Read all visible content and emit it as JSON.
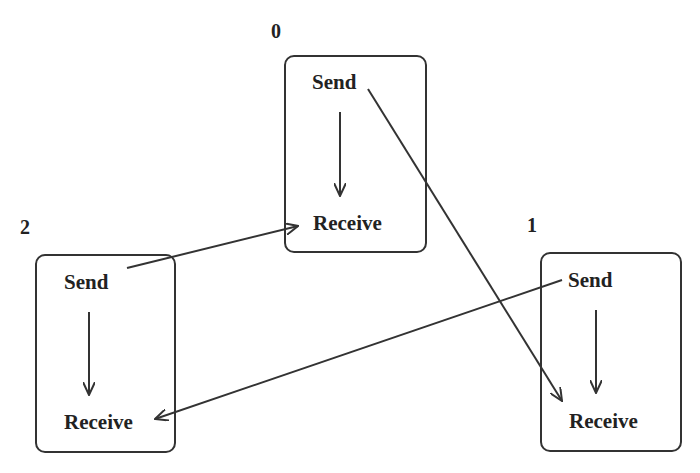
{
  "diagram": {
    "processes": [
      {
        "id": "0",
        "label": "0",
        "send": "Send",
        "receive": "Receive"
      },
      {
        "id": "1",
        "label": "1",
        "send": "Send",
        "receive": "Receive"
      },
      {
        "id": "2",
        "label": "2",
        "send": "Send",
        "receive": "Receive"
      }
    ],
    "edges": [
      {
        "from": "0.Send",
        "to": "1.Receive"
      },
      {
        "from": "1.Send",
        "to": "2.Receive"
      },
      {
        "from": "2.Send",
        "to": "0.Receive"
      },
      {
        "from": "0.Send",
        "to": "0.Receive"
      },
      {
        "from": "1.Send",
        "to": "1.Receive"
      },
      {
        "from": "2.Send",
        "to": "2.Receive"
      }
    ]
  }
}
